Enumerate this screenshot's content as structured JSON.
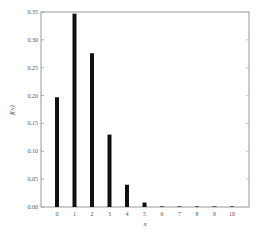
{
  "chart_data": {
    "type": "bar",
    "title": "",
    "xlabel": "x",
    "ylabel": "f(x)",
    "categories": [
      "0",
      "1",
      "2",
      "3",
      "4",
      "5",
      "6",
      "7",
      "8",
      "9",
      "10"
    ],
    "values": [
      0.197,
      0.347,
      0.276,
      0.13,
      0.04,
      0.008,
      0.001,
      0.0003,
      0.0001,
      0.0,
      0.0
    ],
    "ylim": [
      0,
      0.35
    ],
    "yticks": [
      "0.00",
      "0.05",
      "0.10",
      "0.15",
      "0.20",
      "0.25",
      "0.30",
      "0.35"
    ],
    "grid": false,
    "legend": null,
    "bar_color": "#111111",
    "axis_color": "#888888"
  }
}
